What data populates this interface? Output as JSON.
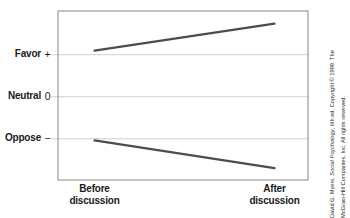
{
  "colors": {
    "background": "#ffffff",
    "text": "#1a1a1a",
    "data_line": "#4d4d4d",
    "plot_border": "#858585",
    "gridline": "#cfcfcf",
    "credit_text": "#2b2b2b"
  },
  "credit": {
    "line1_pre": "David G. Myers, ",
    "line1_title": "Social Psychology",
    "line1_post": ", 6th ed. Copyright © 1999. The",
    "line2": "McGraw-Hill Companies, Inc. All rights reserved."
  },
  "chart_data": {
    "type": "line",
    "title": "",
    "xlabel": "",
    "ylabel": "",
    "categories": [
      "Before discussion",
      "After discussion"
    ],
    "category_lines": [
      [
        "Before",
        "discussion"
      ],
      [
        "After",
        "discussion"
      ]
    ],
    "x_frac": [
      0.146,
      0.866
    ],
    "series": [
      {
        "name": "favor-group",
        "values": [
          0.55,
          0.87
        ]
      },
      {
        "name": "oppose-group",
        "values": [
          -0.52,
          -0.85
        ]
      }
    ],
    "ylim": [
      -0.99,
      1.02
    ],
    "yticks": [
      {
        "label": "Favor",
        "symbol": "+",
        "value": 0.5
      },
      {
        "label": "Neutral",
        "symbol": "0",
        "value": 0
      },
      {
        "label": "Oppose",
        "symbol": "−",
        "value": -0.5
      }
    ],
    "grid": true,
    "legend": "none"
  }
}
